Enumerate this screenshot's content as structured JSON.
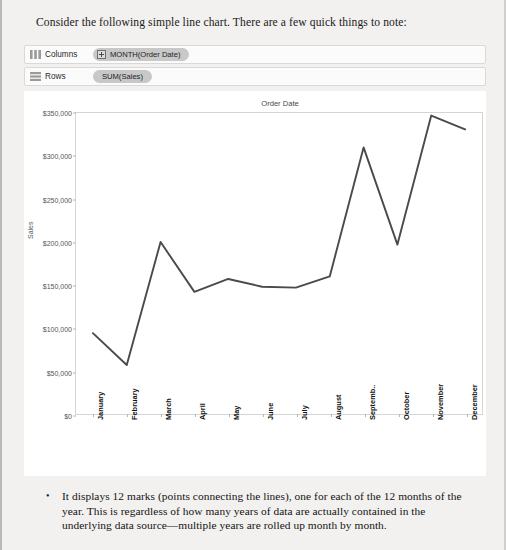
{
  "intro": {
    "text": "Consider the following simple line chart. There are a few quick things to note:"
  },
  "shelves": [
    {
      "icon": "columns-grid-icon",
      "label": "Columns",
      "pill": "MONTH(Order Date)",
      "has_plus": true
    },
    {
      "icon": "rows-grid-icon",
      "label": "Rows",
      "pill": "SUM(Sales)",
      "has_plus": false
    }
  ],
  "chart_data": {
    "type": "line",
    "title": "Order Date",
    "xlabel": "",
    "ylabel": "Sales",
    "categories": [
      "January",
      "February",
      "March",
      "April",
      "May",
      "June",
      "July",
      "August",
      "Septemb..",
      "October",
      "November",
      "December"
    ],
    "values": [
      94000,
      57000,
      200000,
      142000,
      157000,
      148000,
      147000,
      160000,
      310000,
      197000,
      347000,
      331000
    ],
    "ylim": [
      0,
      350000
    ],
    "ytick_values": [
      0,
      50000,
      100000,
      150000,
      200000,
      250000,
      300000,
      350000
    ],
    "ytick_labels": [
      "$0",
      "$50,000",
      "$100,000",
      "$150,000",
      "$200,000",
      "$250,000",
      "$300,000",
      "$350,000"
    ],
    "grid": false,
    "legend": "none",
    "line_color": "#4a4a4a"
  },
  "bullet": {
    "marker": "•",
    "text": "It displays 12 marks (points connecting the lines), one for each of the 12 months of the year. This is regardless of how many years of data are actually contained in the underlying data source—multiple years are rolled up month by month."
  }
}
